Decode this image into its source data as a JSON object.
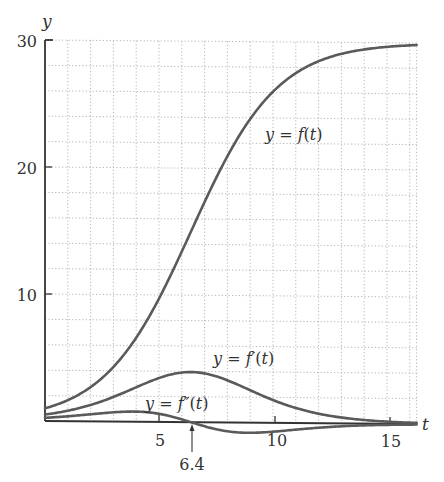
{
  "chart_data": {
    "type": "line",
    "title": "",
    "xlabel": "t",
    "ylabel": "y",
    "xlim": [
      0,
      16.3
    ],
    "ylim": [
      -1,
      30
    ],
    "x_ticks": [
      5,
      10,
      15
    ],
    "y_ticks": [
      10,
      20,
      30
    ],
    "grid": {
      "on": true,
      "x_step": 1,
      "y_step": 2,
      "style": "dotted"
    },
    "model": {
      "carrying_capacity": 30,
      "k": 0.526,
      "t_inflection": 6.4
    },
    "series": [
      {
        "name": "y = f(t)",
        "label_parts": [
          "y = ",
          "f",
          "(",
          "t",
          ")"
        ],
        "x": [
          0,
          2,
          4,
          6,
          6.4,
          8,
          10,
          12,
          14,
          16.3
        ],
        "values": [
          1.0,
          2.7,
          6.7,
          13.4,
          15.0,
          21.0,
          26.5,
          28.8,
          29.6,
          29.9
        ]
      },
      {
        "name": "y = f'(t)",
        "x": [
          0,
          2,
          4,
          6,
          6.4,
          8,
          10,
          12,
          14,
          16.3
        ],
        "values": [
          0.51,
          1.28,
          2.76,
          3.89,
          3.95,
          3.32,
          1.63,
          0.59,
          0.19,
          0.05
        ]
      },
      {
        "name": "y = f''(t)",
        "x": [
          0,
          2,
          4,
          6,
          6.4,
          8,
          10,
          12,
          14,
          16.3
        ],
        "values": [
          0.25,
          0.55,
          0.8,
          0.22,
          0.0,
          -0.7,
          -0.66,
          -0.28,
          -0.09,
          -0.03
        ]
      }
    ],
    "annotations": [
      {
        "text": "6.4",
        "type": "arrow",
        "x": 6.4,
        "note": "inflection point, f''(t)=0"
      }
    ]
  },
  "labels": {
    "y_axis": "y",
    "x_axis": "t",
    "y_tick_10": "10",
    "y_tick_20": "20",
    "y_tick_30": "30",
    "x_tick_5": "5",
    "x_tick_10": "10",
    "x_tick_15": "15",
    "annotation": "6.4",
    "f_label_prefix": "y = ",
    "f_label_fn": "f",
    "f_label_arg": "(t)",
    "fp_label_fn": "f′",
    "fpp_label_fn": "f″"
  },
  "colors": {
    "curve": "#5a5a5a",
    "axis": "#333333",
    "grid": "#b0b0b0"
  }
}
